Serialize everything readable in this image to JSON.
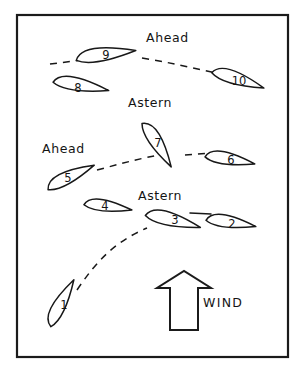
{
  "diagram": {
    "frame": {
      "x": 17,
      "y": 15,
      "width": 271,
      "height": 342,
      "stroke_color": "#1b1b1b"
    },
    "background_color": "#ffffff",
    "ink_color": "#181818"
  },
  "boats": [
    {
      "number": "1",
      "label_x": 64,
      "label_y": 305,
      "cx": 62,
      "cy": 303,
      "angle_deg": -58,
      "length": 52,
      "beam": 18,
      "comment": "lower-left, close-hauled before tack"
    },
    {
      "number": "2",
      "label_x": 232,
      "label_y": 224,
      "cx": 231,
      "cy": 223,
      "angle_deg": 13,
      "length": 50,
      "beam": 17,
      "comment": "right of boat 3"
    },
    {
      "number": "3",
      "label_x": 175,
      "label_y": 220,
      "cx": 173,
      "cy": 221,
      "angle_deg": 18,
      "length": 56,
      "beam": 19,
      "comment": "center, just tacked - astern"
    },
    {
      "number": "4",
      "label_x": 105,
      "label_y": 206,
      "cx": 108,
      "cy": 207,
      "angle_deg": 12,
      "length": 48,
      "beam": 16,
      "comment": "left of boat 3"
    },
    {
      "number": "5",
      "label_x": 68,
      "label_y": 178,
      "cx": 71,
      "cy": 177,
      "angle_deg": -22,
      "length": 52,
      "beam": 18,
      "comment": "ahead position, port side"
    },
    {
      "number": "6",
      "label_x": 231,
      "label_y": 160,
      "cx": 230,
      "cy": 160,
      "angle_deg": 14,
      "length": 50,
      "beam": 17,
      "comment": "right of boat 7"
    },
    {
      "number": "7",
      "label_x": 158,
      "label_y": 143,
      "cx": 157,
      "cy": 145,
      "angle_deg": 62,
      "length": 52,
      "beam": 18,
      "comment": "tacking, near vertical"
    },
    {
      "number": "8",
      "label_x": 78,
      "label_y": 88,
      "cx": 81,
      "cy": 86,
      "angle_deg": 14,
      "length": 56,
      "beam": 18,
      "comment": "lower left of boat 9"
    },
    {
      "number": "9",
      "label_x": 106,
      "label_y": 55,
      "cx": 106,
      "cy": 55,
      "angle_deg": -4,
      "length": 60,
      "beam": 19,
      "comment": "top center - ahead"
    },
    {
      "number": "10",
      "label_x": 239,
      "label_y": 81,
      "cx": 238,
      "cy": 80,
      "angle_deg": 22,
      "length": 54,
      "beam": 18,
      "comment": "top right"
    }
  ],
  "tracks": [
    {
      "name": "track-lower",
      "path": "M 77 290 C 96 262 114 242 147 228",
      "comment": "dashed path from boat 1 up to boat 3"
    },
    {
      "name": "track-middle",
      "path": "M 97 170 C 120 164 140 158 166 154",
      "comment": "dashed path from boat 5 to boat 7"
    },
    {
      "name": "track-middle-right",
      "path": "M 185 155 L 212 153",
      "comment": "short dashed segment from boat 7 to boat 6"
    },
    {
      "name": "track-upper-left",
      "path": "M 50 64 L 82 60",
      "comment": "dashed lead-in at boat 9"
    },
    {
      "name": "track-upper-right",
      "path": "M 142 58 C 168 62 192 68 216 73",
      "comment": "dashed path from boat 9 to boat 10"
    }
  ],
  "solid_links": [
    {
      "name": "link-boat3-boat2",
      "path": "M 190 213 L 211 214",
      "comment": "solid line joining boat 3 bow area to boat 2"
    }
  ],
  "labels": [
    {
      "id": "ahead-top",
      "text": "Ahead",
      "x": 146,
      "y": 38,
      "anchor": "start"
    },
    {
      "id": "astern-upper",
      "text": "Astern",
      "x": 128,
      "y": 103,
      "anchor": "start"
    },
    {
      "id": "ahead-middle",
      "text": "Ahead",
      "x": 42,
      "y": 149,
      "anchor": "start"
    },
    {
      "id": "astern-lower",
      "text": "Astern",
      "x": 138,
      "y": 196,
      "anchor": "start"
    }
  ],
  "wind": {
    "label": "WIND",
    "label_x": 203,
    "label_y": 303,
    "arrow": {
      "path": "M 170 330 L 170 288 L 157 288 L 184 271 L 211 288 L 198 288 L 198 330 Z",
      "direction": "up",
      "stroke_color": "#1b1b1b",
      "fill_color": "#ffffff"
    }
  }
}
